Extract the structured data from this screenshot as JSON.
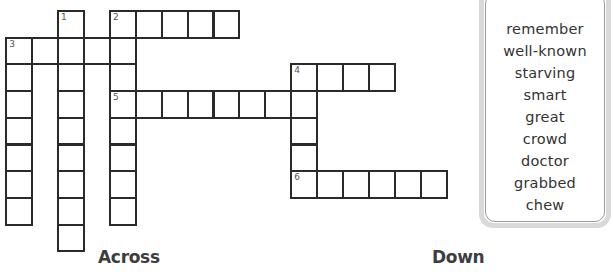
{
  "puzzle": {
    "grid": {
      "cell_width": 25.9,
      "cell_height": 26.7,
      "origin_x": 6.3,
      "origin_y": 11,
      "entries": [
        {
          "number": "1",
          "direction": "down",
          "row": 0,
          "col": 2,
          "length": 9
        },
        {
          "number": "2",
          "direction": "down",
          "row": 0,
          "col": 4,
          "length": 8
        },
        {
          "number": "2",
          "direction": "across",
          "row": 0,
          "col": 4,
          "length": 5
        },
        {
          "number": "3",
          "direction": "across",
          "row": 1,
          "col": 0,
          "length": 5
        },
        {
          "number": "3",
          "direction": "down",
          "row": 1,
          "col": 0,
          "length": 7
        },
        {
          "number": "4",
          "direction": "across",
          "row": 2,
          "col": 11,
          "length": 4
        },
        {
          "number": "4",
          "direction": "down",
          "row": 2,
          "col": 11,
          "length": 5
        },
        {
          "number": "5",
          "direction": "across",
          "row": 3,
          "col": 4,
          "length": 8
        },
        {
          "number": "6",
          "direction": "across",
          "row": 6,
          "col": 11,
          "length": 6
        }
      ]
    },
    "headings": {
      "across": "Across",
      "down": "Down"
    },
    "word_bank": {
      "words": [
        "remember",
        "well-known",
        "starving",
        "smart",
        "great",
        "crowd",
        "doctor",
        "grabbed",
        "chew"
      ]
    }
  }
}
